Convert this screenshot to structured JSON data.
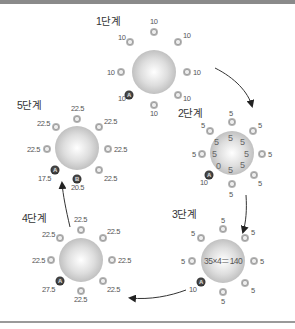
{
  "stages": [
    {
      "label": "1단계",
      "center": [
        162,
        73
      ],
      "outer": [
        "10",
        "10",
        "10",
        "10",
        "10",
        "10",
        "10",
        "10"
      ],
      "special": {
        "badge": "A",
        "value": "10"
      }
    },
    {
      "label": "2단계",
      "center": [
        245,
        155
      ],
      "outer": [
        "5",
        "5",
        "5",
        "5",
        "5",
        "5",
        "5",
        "5"
      ],
      "inner": [
        "5",
        "5",
        "5",
        "5",
        "5",
        "5",
        "0",
        "5"
      ],
      "special": {
        "badge": "A",
        "value": "10"
      }
    },
    {
      "label": "3단계",
      "center": [
        225,
        262
      ],
      "outer": [
        "5",
        "5",
        "5",
        "5",
        "5",
        "5",
        "5",
        "5"
      ],
      "formula": "35×4＝140",
      "special": {
        "badge": "A",
        "value": "10"
      }
    },
    {
      "label": "4단계",
      "center": [
        82,
        258
      ],
      "outer": [
        "22.5",
        "22.5",
        "22.5",
        "22.5",
        "22.5",
        "22.5",
        "22.5",
        "22.5"
      ],
      "special": {
        "badge": "A",
        "value": "27.5"
      }
    },
    {
      "label": "5단계",
      "center": [
        77,
        148
      ],
      "outer": [
        "22.5",
        "22.5",
        "22.5",
        "22.5",
        "22.5",
        "22.5",
        "22.5"
      ],
      "special": {
        "badge": "A",
        "value": "17.5"
      },
      "special2": {
        "badge": "B",
        "value": "20.5"
      }
    }
  ],
  "colors": {
    "ball": "#c8c8c8",
    "ring": "#a8a8a8",
    "badge": "#3a3a3a",
    "arrow": "#222222",
    "text": "#555555"
  }
}
